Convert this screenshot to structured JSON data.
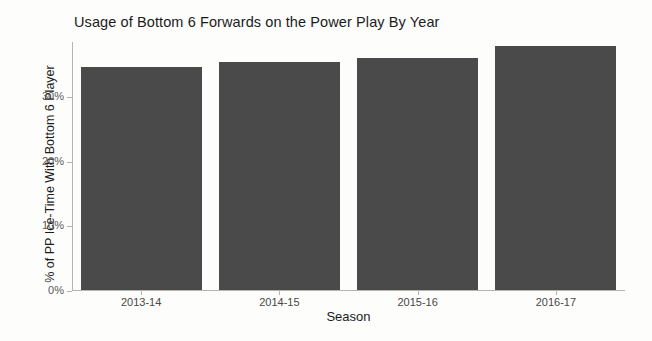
{
  "chart_data": {
    "type": "bar",
    "title": "Usage of Bottom 6 Forwards on the Power Play By Year",
    "xlabel": "Season",
    "ylabel": "% of PP Ice-Time With Bottom 6 Player",
    "categories": [
      "2013-14",
      "2014-15",
      "2015-16",
      "2016-17"
    ],
    "values": [
      34.5,
      35.2,
      35.8,
      37.8
    ],
    "ytick_labels": [
      "0%",
      "10%",
      "20%",
      "30%"
    ],
    "ytick_values": [
      0,
      10,
      20,
      30
    ],
    "ylim": [
      0,
      38.5
    ],
    "grid": false,
    "legend": false,
    "bar_color": "#4a4a4a",
    "axis_color": "#b4b4b4",
    "background_color": "#fdfdfc"
  }
}
